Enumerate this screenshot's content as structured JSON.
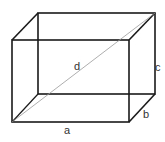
{
  "diagram": {
    "labels": {
      "diagonal": "d",
      "height": "c",
      "depth": "b",
      "width": "a"
    },
    "colors": {
      "edges": "#1a1a1a",
      "diagonal": "#999999",
      "text": "#333333"
    }
  }
}
